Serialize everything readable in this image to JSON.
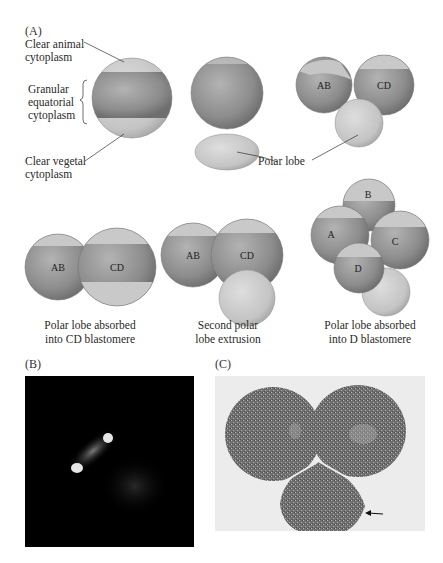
{
  "panels": {
    "a": {
      "label": "(A)",
      "annotations": {
        "clear_animal": [
          "Clear animal",
          "cytoplasm"
        ],
        "granular": [
          "Granular",
          "equatorial",
          "cytoplasm"
        ],
        "clear_vegetal": [
          "Clear vegetal",
          "cytoplasm"
        ],
        "polar_lobe": "Polar lobe"
      },
      "stages": [
        {
          "id": "uncleaved-egg",
          "cells": []
        },
        {
          "id": "first-polar-lobe",
          "cells": []
        },
        {
          "id": "two-cell-with-lobe",
          "cells": [
            "AB",
            "CD"
          ]
        },
        {
          "id": "two-cell-absorbed",
          "cells": [
            "AB",
            "CD"
          ],
          "caption": [
            "Polar lobe absorbed",
            "into CD blastomere"
          ]
        },
        {
          "id": "second-polar-lobe",
          "cells": [
            "AB",
            "CD"
          ],
          "caption": [
            "Second polar",
            "lobe extrusion"
          ]
        },
        {
          "id": "four-cell",
          "cells": [
            "A",
            "B",
            "C",
            "D"
          ],
          "caption": [
            "Polar lobe absorbed",
            "into D blastomere"
          ]
        }
      ]
    },
    "b": {
      "label": "(B)"
    },
    "c": {
      "label": "(C)"
    }
  },
  "colors": {
    "granular": "#8d8d8d",
    "clear": "#c8c8c8",
    "background": "#ffffff",
    "fluorescence_bg": "#000000"
  }
}
